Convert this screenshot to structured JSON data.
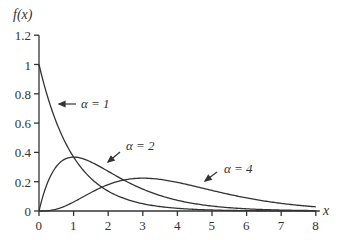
{
  "chart_data": {
    "type": "line",
    "title": "",
    "xlabel": "x",
    "ylabel": "f(x)",
    "xlim": [
      0,
      8
    ],
    "ylim": [
      0,
      1.2
    ],
    "xticks": [
      "0",
      "1",
      "2",
      "3",
      "4",
      "5",
      "6",
      "7",
      "8"
    ],
    "yticks": [
      "0",
      "0.2",
      "0.4",
      "0.6",
      "0.8",
      "1",
      "1.2"
    ],
    "grid": false,
    "series": [
      {
        "name": "α = 1",
        "alpha": 1,
        "formula": "e^{-x}",
        "x": [
          0,
          1,
          2,
          3,
          4,
          5,
          6,
          7,
          8
        ],
        "values": [
          1.0,
          0.368,
          0.135,
          0.05,
          0.018,
          0.007,
          0.002,
          0.001,
          0.0
        ]
      },
      {
        "name": "α = 2",
        "alpha": 2,
        "formula": "x e^{-x}",
        "x": [
          0,
          1,
          2,
          3,
          4,
          5,
          6,
          7,
          8
        ],
        "values": [
          0.0,
          0.368,
          0.271,
          0.149,
          0.073,
          0.034,
          0.015,
          0.006,
          0.003
        ]
      },
      {
        "name": "α = 4",
        "alpha": 4,
        "formula": "x^3 e^{-x}/6",
        "x": [
          0,
          1,
          2,
          3,
          4,
          5,
          6,
          7,
          8
        ],
        "values": [
          0.0,
          0.061,
          0.18,
          0.224,
          0.195,
          0.14,
          0.089,
          0.052,
          0.029
        ]
      }
    ],
    "annotations": [
      {
        "text": "α = 1",
        "points_to_series": "α = 1"
      },
      {
        "text": "α = 2",
        "points_to_series": "α = 2"
      },
      {
        "text": "α = 4",
        "points_to_series": "α = 4"
      }
    ]
  },
  "labels": {
    "ylabel": "f(x)",
    "xlabel": "x",
    "ann1": "α = 1",
    "ann2": "α = 2",
    "ann4": "α = 4"
  }
}
